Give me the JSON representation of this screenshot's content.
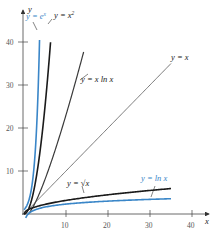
{
  "chart_data": {
    "type": "line",
    "title": "",
    "xlabel": "x",
    "ylabel": "y",
    "xlim": [
      0,
      44
    ],
    "ylim": [
      0,
      46
    ],
    "grid": false,
    "legend": "inline labels",
    "x_ticks": [
      10,
      20,
      30,
      40
    ],
    "y_ticks": [
      10,
      20,
      30,
      40
    ],
    "series": [
      {
        "name": "y = e^x",
        "label": "y = e",
        "label_sup": "x",
        "color": "#3a86c8",
        "width": 1.6,
        "fn": "exp",
        "x_range": [
          0,
          3.7
        ]
      },
      {
        "name": "y = x^2",
        "label": "y = x",
        "label_sup": "2",
        "color": "#1a1a1a",
        "width": 1.6,
        "fn": "sq",
        "x_range": [
          0,
          6.32
        ]
      },
      {
        "name": "y = x ln x",
        "label": "y = x ln x",
        "label_sup": "",
        "color": "#3a3a3a",
        "width": 1.2,
        "fn": "xlnx",
        "x_range": [
          1,
          14.2
        ]
      },
      {
        "name": "y = x",
        "label": "y = x",
        "label_sup": "",
        "color": "#555555",
        "width": 0.8,
        "fn": "id",
        "x_range": [
          0,
          35
        ]
      },
      {
        "name": "y = sqrt(x)",
        "label": "y = √x",
        "label_sup": "",
        "color": "#1a1a1a",
        "width": 1.6,
        "fn": "sqrt",
        "x_range": [
          0,
          35
        ]
      },
      {
        "name": "y = ln x",
        "label": "y = ln x",
        "label_sup": "",
        "color": "#3a86c8",
        "width": 1.6,
        "fn": "ln",
        "x_range": [
          0.4,
          35
        ]
      }
    ],
    "sample_points": {
      "y = x": [
        [
          0,
          0
        ],
        [
          10,
          10
        ],
        [
          20,
          20
        ],
        [
          30,
          30
        ],
        [
          35,
          35
        ]
      ],
      "y = sqrt(x)": [
        [
          0,
          0
        ],
        [
          10,
          3.16
        ],
        [
          20,
          4.47
        ],
        [
          30,
          5.48
        ],
        [
          35,
          5.92
        ]
      ],
      "y = ln x": [
        [
          1,
          0
        ],
        [
          10,
          2.3
        ],
        [
          20,
          3.0
        ],
        [
          30,
          3.4
        ],
        [
          35,
          3.56
        ]
      ],
      "y = x^2": [
        [
          0,
          0
        ],
        [
          2,
          4
        ],
        [
          4,
          16
        ],
        [
          6,
          36
        ],
        [
          6.32,
          40
        ]
      ],
      "y = e^x": [
        [
          0,
          1
        ],
        [
          1,
          2.72
        ],
        [
          2,
          7.39
        ],
        [
          3,
          20.09
        ],
        [
          3.7,
          40.4
        ]
      ],
      "y = x ln x": [
        [
          1,
          0
        ],
        [
          5,
          8.05
        ],
        [
          10,
          23.03
        ],
        [
          14.2,
          37.7
        ]
      ]
    }
  },
  "axes": {
    "x_label": "x",
    "y_label": "y",
    "x_tick_labels": [
      "10",
      "20",
      "30",
      "40"
    ],
    "y_tick_labels": [
      "10",
      "20",
      "30",
      "40"
    ]
  },
  "labels": {
    "exp": {
      "base": "y = e",
      "sup": "x"
    },
    "sq": {
      "base": "y = x",
      "sup": "2"
    },
    "xlnx": "y = x ln x",
    "id": "y = x",
    "sqrt": "y = √x",
    "ln": "y = ln x"
  }
}
